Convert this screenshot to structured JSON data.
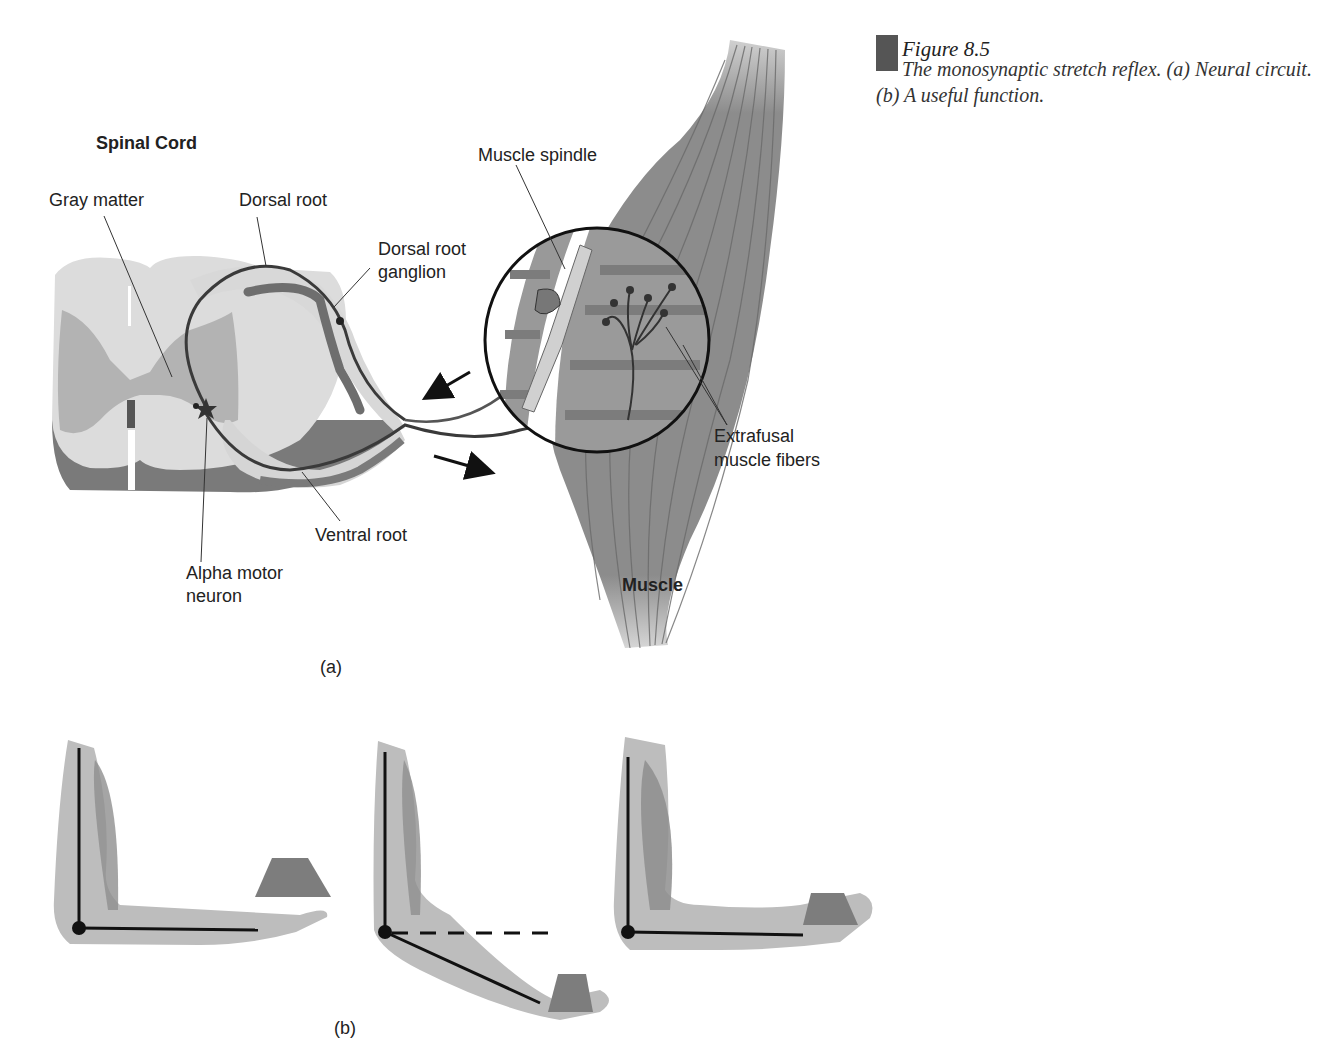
{
  "caption": {
    "figure_number": "Figure 8.5",
    "text": "The monosynaptic stretch reflex. (a) Neural circuit. (b) A useful function.",
    "bar_color": "#555555"
  },
  "panel_a": {
    "panel_label": "(a)",
    "labels": {
      "spinal_cord": "Spinal Cord",
      "gray_matter": "Gray matter",
      "dorsal_root": "Dorsal root",
      "dorsal_root_ganglion_line1": "Dorsal root",
      "dorsal_root_ganglion_line2": "ganglion",
      "muscle_spindle": "Muscle spindle",
      "extrafusal_line1": "Extrafusal",
      "extrafusal_line2": "muscle fibers",
      "ventral_root": "Ventral root",
      "alpha_motor_line1": "Alpha motor",
      "alpha_motor_line2": "neuron",
      "muscle": "Muscle"
    }
  },
  "panel_b": {
    "panel_label": "(b)",
    "states": [
      "arm-holding-position-before-weight",
      "arm-drops-under-weight",
      "arm-restored-by-reflex"
    ]
  },
  "colors": {
    "tissue_light": "#d9d9d9",
    "gray_matter": "#b3b3b3",
    "shadow": "#7a7a7a",
    "muscle": "#8c8c8c",
    "nerve": "#444444",
    "arm": "#bdbdbd",
    "weight": "#7d7d7d"
  }
}
